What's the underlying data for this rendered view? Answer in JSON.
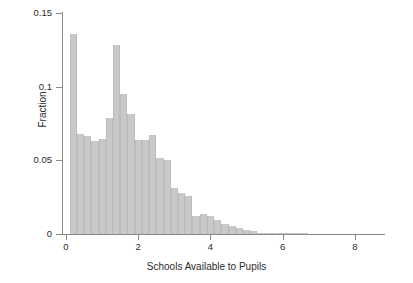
{
  "chart_data": {
    "type": "bar",
    "title": "",
    "subtitle": "",
    "xlabel": "Schools Available to Pupils",
    "ylabel": "Fraction",
    "xlim": [
      0,
      8.5
    ],
    "ylim": [
      0,
      0.15
    ],
    "xticks": [
      0,
      2,
      4,
      6,
      8
    ],
    "xtick_labels": [
      "0",
      "2",
      "4",
      "6",
      "8"
    ],
    "yticks": [
      0,
      0.05,
      0.1,
      0.15
    ],
    "ytick_labels": [
      "0",
      "0.05",
      "0.1",
      "0.15"
    ],
    "grid": false,
    "legend": null,
    "bin_width": 0.2,
    "bar_color": "#c9c9c9",
    "axis_color": "#8a8a8a",
    "text_color": "#2b2b2b",
    "bin_left_edges": [
      0.1,
      0.3,
      0.5,
      0.7,
      0.9,
      1.1,
      1.3,
      1.5,
      1.7,
      1.9,
      2.1,
      2.3,
      2.5,
      2.7,
      2.9,
      3.1,
      3.3,
      3.5,
      3.7,
      3.9,
      4.1,
      4.3,
      4.5,
      4.7,
      4.9,
      5.1,
      5.3,
      5.5,
      5.7,
      5.9,
      6.1,
      6.3,
      6.5,
      6.7,
      6.9,
      7.1,
      7.3,
      7.5,
      7.7,
      7.9
    ],
    "categories": [
      "0.1",
      "0.3",
      "0.5",
      "0.7",
      "0.9",
      "1.1",
      "1.3",
      "1.5",
      "1.7",
      "1.9",
      "2.1",
      "2.3",
      "2.5",
      "2.7",
      "2.9",
      "3.1",
      "3.3",
      "3.5",
      "3.7",
      "3.9",
      "4.1",
      "4.3",
      "4.5",
      "4.7",
      "4.9",
      "5.1",
      "5.3",
      "5.5",
      "5.7",
      "5.9",
      "6.1",
      "6.3",
      "6.5",
      "6.7",
      "6.9",
      "7.1",
      "7.3",
      "7.5",
      "7.7",
      "7.9"
    ],
    "values": [
      0.1355,
      0.068,
      0.0665,
      0.063,
      0.0645,
      0.079,
      0.128,
      0.095,
      0.0815,
      0.0635,
      0.0635,
      0.0675,
      0.0515,
      0.05,
      0.031,
      0.0275,
      0.026,
      0.012,
      0.0135,
      0.012,
      0.0095,
      0.007,
      0.0055,
      0.004,
      0.003,
      0.0022,
      0.001,
      0.0008,
      0.0005,
      0.0003,
      0.0002,
      0.0001,
      0.0001,
      0.0,
      0.0,
      0.0,
      0.0,
      0.0,
      0.0,
      0.0
    ]
  }
}
